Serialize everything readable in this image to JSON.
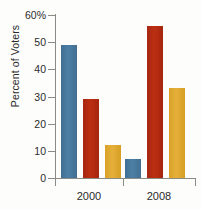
{
  "chart_data": {
    "type": "bar",
    "title": "",
    "subtitle": "",
    "xlabel": "",
    "ylabel": "Percent of Voters",
    "categories": [
      "2000",
      "2008"
    ],
    "ylim": [
      0,
      60
    ],
    "yticks": [
      0,
      10,
      20,
      30,
      40,
      50,
      60
    ],
    "ytick_labels": [
      "0",
      "10",
      "20",
      "30",
      "40",
      "50",
      "60%"
    ],
    "grid": false,
    "legend": "none",
    "series": [
      {
        "name": "series-1",
        "color": "#4c7fa6",
        "values": [
          49,
          7
        ]
      },
      {
        "name": "series-2",
        "color": "#bc2f12",
        "values": [
          29,
          56
        ]
      },
      {
        "name": "series-3",
        "color": "#e5b03a",
        "values": [
          12,
          33
        ]
      }
    ],
    "annotations": []
  },
  "axis": {
    "y_title": "Percent of Voters",
    "y_tick_labels": [
      "60%",
      "50",
      "40",
      "30",
      "20",
      "10",
      "0"
    ],
    "x_tick_labels": [
      "2000",
      "2008"
    ]
  },
  "colors": {
    "series_1": "#4c7fa6",
    "series_2": "#bc2f12",
    "series_3": "#e5b03a",
    "axis": "#8b8b86",
    "text": "#2b2b2b",
    "background": "#fdfdfc"
  }
}
